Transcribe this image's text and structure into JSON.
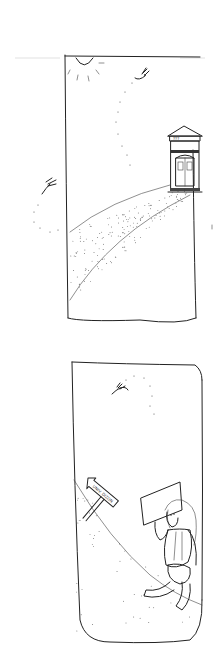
{
  "comic": {
    "title": "",
    "panels": [
      {
        "id": "panel-1",
        "scene": "Sun in top-left corner, a dragonfly flying along a dotted path toward a small ornate building on a hill; speckled path curving down the hill",
        "building_sign": "???",
        "elements": [
          "sun",
          "dragonfly",
          "dragonfly-trail",
          "building",
          "hill-path",
          "outside-dragonfly"
        ]
      },
      {
        "id": "panel-2",
        "scene": "A dragonfly overhead; a traveler with long hair and a backpack walks down a hill, holding up a blank sign; a wooden arrow signpost points up the hill",
        "signpost_text": "UNIV. DIZON",
        "elements": [
          "dragonfly",
          "signpost",
          "traveler",
          "held-sign",
          "hill-slope"
        ]
      }
    ]
  }
}
